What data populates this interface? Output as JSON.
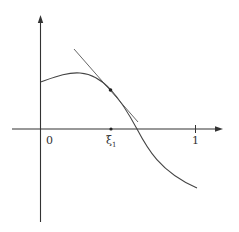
{
  "diagram": {
    "type": "function-plot-with-tangent",
    "labels": {
      "origin": "0",
      "xi_symbol": "ξ",
      "xi_subscript": "1",
      "one": "1"
    },
    "colors": {
      "axis": "#333333",
      "curve": "#444444",
      "tangent": "#555555",
      "point": "#222222",
      "background": "#ffffff"
    },
    "elements": {
      "x_axis": "horizontal axis with arrow at right",
      "y_axis": "vertical axis with arrow at top",
      "curve": "smooth curve starting on y-axis, rising to a maximum, then decreasing through the x-axis",
      "tangent_line": "tangent line to the curve at the point above ξ1",
      "tangent_point": "marked point on curve at x = ξ1",
      "ticks": [
        "ξ1",
        "1"
      ]
    }
  }
}
